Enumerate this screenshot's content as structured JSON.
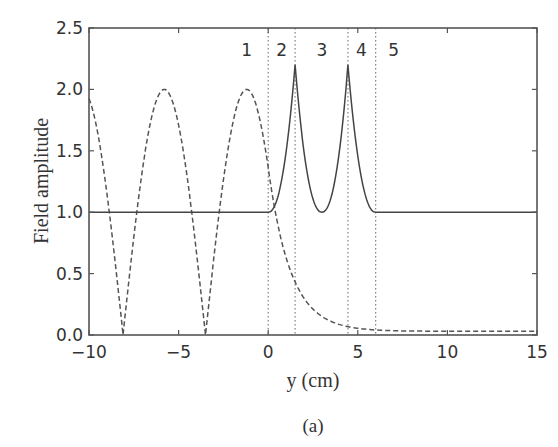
{
  "chart_data": {
    "type": "line",
    "title": "",
    "caption": "(a)",
    "xlabel": "y (cm)",
    "ylabel": "Field amplitude",
    "xlim": [
      -10,
      15
    ],
    "ylim": [
      0,
      2.5
    ],
    "xticks": [
      -10,
      -5,
      0,
      5,
      10,
      15
    ],
    "xtick_labels": [
      "−10",
      "−5",
      "0",
      "5",
      "10",
      "15"
    ],
    "yticks": [
      0.0,
      0.5,
      1.0,
      1.5,
      2.0,
      2.5
    ],
    "ytick_labels": [
      "0.0",
      "0.5",
      "1.0",
      "1.5",
      "2.0",
      "2.5"
    ],
    "grid": false,
    "legend": null,
    "region_boundaries": [
      0,
      1.5,
      4.45,
      6.0
    ],
    "region_labels": [
      {
        "label": "1",
        "x": -1.2
      },
      {
        "label": "2",
        "x": 0.75
      },
      {
        "label": "3",
        "x": 3.0
      },
      {
        "label": "4",
        "x": 5.2
      },
      {
        "label": "5",
        "x": 7.0
      }
    ],
    "series": [
      {
        "name": "solid",
        "style": "solid",
        "x": [
          -10,
          0,
          0.5,
          1.0,
          1.5,
          2.0,
          2.5,
          3.0,
          3.5,
          4.0,
          4.45,
          5.0,
          5.5,
          6.0,
          15
        ],
        "y": [
          1.0,
          1.0,
          1.15,
          1.5,
          2.2,
          1.5,
          1.15,
          1.0,
          1.15,
          1.5,
          2.2,
          1.5,
          1.15,
          1.0,
          1.0
        ]
      },
      {
        "name": "dashed",
        "style": "dashed",
        "x": [
          -10,
          -9,
          -8.0,
          -7,
          -5.8,
          -4.6,
          -3.5,
          -2.4,
          -1.2,
          0,
          1,
          2,
          3,
          4,
          5,
          15
        ],
        "y": [
          1.95,
          1.3,
          0.05,
          1.3,
          1.98,
          1.3,
          0.05,
          1.3,
          1.98,
          1.3,
          0.75,
          0.38,
          0.17,
          0.07,
          0.03,
          0.03
        ]
      }
    ]
  }
}
